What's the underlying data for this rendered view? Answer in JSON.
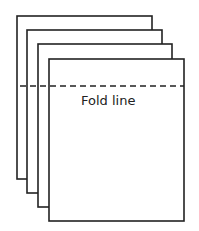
{
  "diagram": {
    "fold_label": "Fold line",
    "stroke_color": "#222222",
    "background": "#ffffff",
    "sheets": [
      {
        "x": 17,
        "y": 16,
        "w": 135,
        "h": 163
      },
      {
        "x": 27,
        "y": 30,
        "w": 135,
        "h": 163
      },
      {
        "x": 38,
        "y": 44,
        "w": 134,
        "h": 163
      },
      {
        "x": 49,
        "y": 59,
        "w": 135,
        "h": 162
      }
    ],
    "fold_line": {
      "x1": 20,
      "x2": 184,
      "y": 86
    }
  }
}
